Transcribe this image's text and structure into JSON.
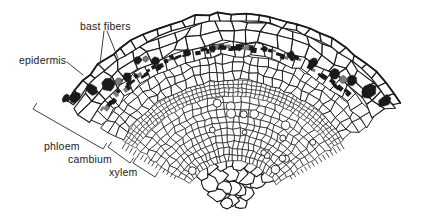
{
  "figure": {
    "labels": {
      "bast_fibers": "bast fibers",
      "epidermis": "epidermis",
      "phloem": "phloem",
      "cambium": "cambium",
      "xylem": "xylem"
    },
    "colors": {
      "ink": "#1a1a1a",
      "background": "#ffffff",
      "annotation": "#3f3f3f",
      "gray_cell": "#7a7a7a"
    }
  }
}
